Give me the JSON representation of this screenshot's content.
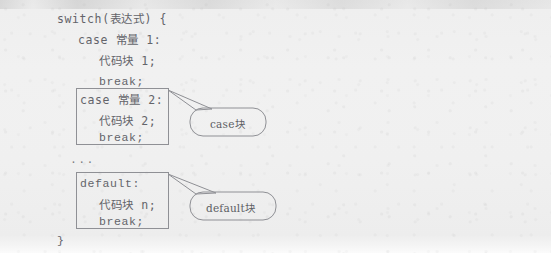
{
  "figure": {
    "kind": "scanned-book-figure",
    "topic": "switch statement syntax",
    "background_color": "#f0f0f0",
    "text_color": "#63646a",
    "box_border_color": "#8f9095",
    "callout_border_color": "#8f9095",
    "callout_text_color": "#5d5e64"
  },
  "code": {
    "lines": [
      {
        "text": "switch(表达式) {",
        "indent": 0
      },
      {
        "text": "case 常量 1:",
        "indent": 1
      },
      {
        "text": "代码块 1;",
        "indent": 2
      },
      {
        "text": "break;",
        "indent": 2
      },
      {
        "text": "case 常量 2:",
        "indent": 1
      },
      {
        "text": "代码块 2;",
        "indent": 2
      },
      {
        "text": "break;",
        "indent": 2
      },
      {
        "text": "...",
        "indent": 1
      },
      {
        "text": "default:",
        "indent": 1
      },
      {
        "text": "代码块 n;",
        "indent": 2
      },
      {
        "text": "break;",
        "indent": 2
      },
      {
        "text": "}",
        "indent": 0
      }
    ],
    "switch_header": "switch(表达式) {",
    "case1_label": "case 常量 1:",
    "case1_body": "代码块 1;",
    "case1_break": "break;",
    "case2_label": "case 常量 2:",
    "case2_body": "代码块 2;",
    "case2_break": "break;",
    "ellipsis": "...",
    "default_label": "default:",
    "default_body": "代码块 n;",
    "default_break": "break;",
    "closing_brace": "}"
  },
  "annotations": {
    "case_block": {
      "label": "case块",
      "points_to": "case 常量 2 block"
    },
    "default_block": {
      "label": "default块",
      "points_to": "default block"
    }
  }
}
